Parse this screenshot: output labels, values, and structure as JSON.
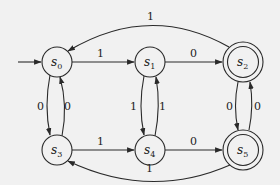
{
  "diagram": {
    "type": "finite-state-automaton",
    "background": "#f1f1f1",
    "stroke_color": "#2a2a2a",
    "start_state": "s0",
    "states": [
      {
        "id": "s0",
        "base": "s",
        "sub": "0",
        "accepting": false,
        "x": 57,
        "y": 62
      },
      {
        "id": "s1",
        "base": "s",
        "sub": "1",
        "accepting": false,
        "x": 150,
        "y": 62
      },
      {
        "id": "s2",
        "base": "s",
        "sub": "2",
        "accepting": true,
        "x": 243,
        "y": 62
      },
      {
        "id": "s3",
        "base": "s",
        "sub": "3",
        "accepting": false,
        "x": 57,
        "y": 150
      },
      {
        "id": "s4",
        "base": "s",
        "sub": "4",
        "accepting": false,
        "x": 150,
        "y": 150
      },
      {
        "id": "s5",
        "base": "s",
        "sub": "5",
        "accepting": true,
        "x": 243,
        "y": 150
      }
    ],
    "transitions": [
      {
        "from": "s0",
        "to": "s1",
        "label": "1"
      },
      {
        "from": "s1",
        "to": "s2",
        "label": "0"
      },
      {
        "from": "s2",
        "to": "s0",
        "label": "1"
      },
      {
        "from": "s0",
        "to": "s3",
        "label": "0"
      },
      {
        "from": "s3",
        "to": "s0",
        "label": "0"
      },
      {
        "from": "s1",
        "to": "s4",
        "label": "1"
      },
      {
        "from": "s4",
        "to": "s1",
        "label": "1"
      },
      {
        "from": "s2",
        "to": "s5",
        "label": "0"
      },
      {
        "from": "s5",
        "to": "s2",
        "label": "0"
      },
      {
        "from": "s3",
        "to": "s4",
        "label": "1"
      },
      {
        "from": "s4",
        "to": "s5",
        "label": "0"
      },
      {
        "from": "s5",
        "to": "s3",
        "label": "1"
      }
    ]
  }
}
